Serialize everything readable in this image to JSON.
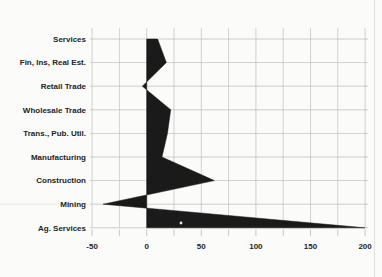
{
  "chart_data": {
    "type": "area",
    "orientation": "horizontal",
    "title": "",
    "xlabel": "",
    "ylabel": "",
    "categories": [
      "Services",
      "Fin, Ins, Real Est.",
      "Retail Trade",
      "Wholesale Trade",
      "Trans., Pub. Util.",
      "Manufacturing",
      "Construction",
      "Mining",
      "Ag. Services"
    ],
    "values": [
      10,
      18,
      -4,
      22,
      19,
      14,
      62,
      -40,
      200
    ],
    "x_tick_labels": [
      "-50",
      "0",
      "50",
      "100",
      "150",
      "200"
    ],
    "x_tick_values": [
      -50,
      0,
      50,
      100,
      150,
      200
    ],
    "x_minor_step": 25,
    "xlim": [
      -50,
      200
    ],
    "baseline": 0,
    "grid": true,
    "legend": "none",
    "colors": {
      "background": "#fbfbfa",
      "fill": "#1a1a1a",
      "gridline": "#b9b9b6",
      "label": "#242424",
      "edge_border": "#dcdcdc"
    },
    "artifacts": [
      "small white speck inside Ag. Services area",
      "faint full-width line at Mining row",
      "faint vertical line at right edge"
    ]
  }
}
